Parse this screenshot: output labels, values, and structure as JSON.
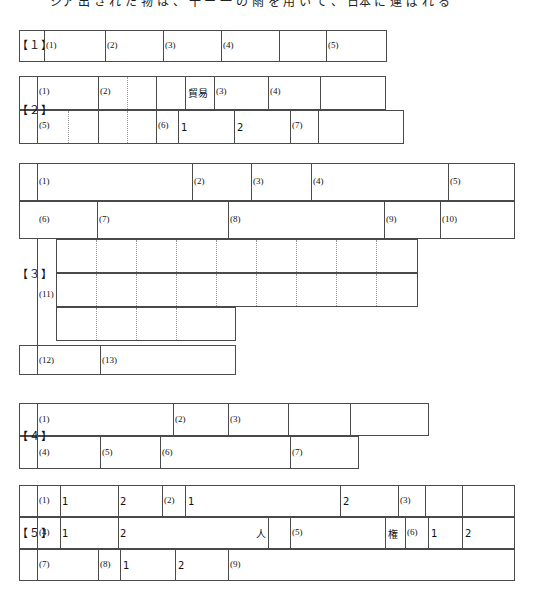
{
  "page": {
    "width": 534,
    "height": 605,
    "background": "#ffffff",
    "line_color": "#4a4a4a",
    "dotted_color": "#9a9a9a"
  },
  "top_strip": {
    "visible_text": "ジア 出 さ れ た 物 は 、 十 ー 一 の 雨 を 用 い て 、 日本 に 運 ば れ る"
  },
  "sections": [
    {
      "id": "s1",
      "number": "【１】",
      "answer_labels": [
        "(1)",
        "(2)",
        "(3)",
        "(4)",
        "(5)"
      ],
      "prefilled": []
    },
    {
      "id": "s2",
      "number": "【２】",
      "answer_labels": [
        "(1)",
        "(2)",
        "(3)",
        "(4)",
        "(5)",
        "(6)",
        "(7)"
      ],
      "prefilled": [
        {
          "text": "貿易",
          "row": 1
        },
        {
          "text": "1",
          "row": 2
        },
        {
          "text": "2",
          "row": 2
        }
      ]
    },
    {
      "id": "s3",
      "number": "【３】",
      "answer_labels": [
        "(1)",
        "(2)",
        "(3)",
        "(4)",
        "(5)",
        "(6)",
        "(7)",
        "(8)",
        "(9)",
        "(10)",
        "(11)",
        "(12)",
        "(13)"
      ],
      "prefilled": []
    },
    {
      "id": "s4",
      "number": "【４】",
      "answer_labels": [
        "(1)",
        "(2)",
        "(3)",
        "(4)",
        "(5)",
        "(6)",
        "(7)"
      ],
      "prefilled": []
    },
    {
      "id": "s5",
      "number": "【５】",
      "answer_labels": [
        "(1)",
        "(2)",
        "(3)",
        "(4)",
        "(5)",
        "(6)",
        "(7)",
        "(8)",
        "(9)"
      ],
      "prefilled": [
        {
          "text": "1",
          "after": "(1)"
        },
        {
          "text": "2",
          "after": "(1)"
        },
        {
          "text": "1",
          "after": "(2)"
        },
        {
          "text": "2",
          "after": "(2)"
        },
        {
          "text": "1",
          "after": "(4)"
        },
        {
          "text": "2",
          "after": "(4)"
        },
        {
          "text": "人",
          "after": "(4)"
        },
        {
          "text": "権",
          "after": "(5)"
        },
        {
          "text": "1",
          "after": "(6)"
        },
        {
          "text": "2",
          "after": "(6)"
        },
        {
          "text": "1",
          "after": "(8)"
        },
        {
          "text": "2",
          "after": "(8)"
        }
      ]
    }
  ]
}
